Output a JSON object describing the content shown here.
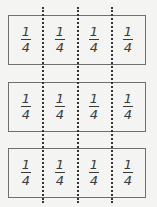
{
  "diagram": {
    "fold_lines": 3,
    "strips": [
      {
        "cells": [
          {
            "numerator": "1",
            "denominator": "4"
          },
          {
            "numerator": "1",
            "denominator": "4"
          },
          {
            "numerator": "1",
            "denominator": "4"
          },
          {
            "numerator": "1",
            "denominator": "4"
          }
        ]
      },
      {
        "cells": [
          {
            "numerator": "1",
            "denominator": "4"
          },
          {
            "numerator": "1",
            "denominator": "4"
          },
          {
            "numerator": "1",
            "denominator": "4"
          },
          {
            "numerator": "1",
            "denominator": "4"
          }
        ]
      },
      {
        "cells": [
          {
            "numerator": "1",
            "denominator": "4"
          },
          {
            "numerator": "1",
            "denominator": "4"
          },
          {
            "numerator": "1",
            "denominator": "4"
          },
          {
            "numerator": "1",
            "denominator": "4"
          }
        ]
      }
    ],
    "colors": {
      "background": "#f4f4f3",
      "border": "#6f6f6f",
      "text": "#3a3a3a"
    }
  }
}
